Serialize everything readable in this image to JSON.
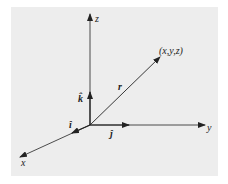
{
  "diagram": {
    "background_color": "#ededed",
    "line_color": "#222222",
    "origin": [
      90,
      125
    ],
    "axes": [
      {
        "name": "x",
        "label": "x",
        "end": [
          20,
          157
        ]
      },
      {
        "name": "y",
        "label": "y",
        "end": [
          205,
          125
        ]
      },
      {
        "name": "z",
        "label": "z",
        "end": [
          90,
          14
        ]
      }
    ],
    "unit_vectors": [
      {
        "name": "i-hat",
        "label": "î",
        "end": [
          73,
          133
        ]
      },
      {
        "name": "j-hat",
        "label": "ĵ",
        "end": [
          128,
          125
        ]
      },
      {
        "name": "k-hat",
        "label": "k̂",
        "end": [
          90,
          93
        ]
      }
    ],
    "position_vector": {
      "label": "r",
      "end": [
        160,
        57
      ],
      "point_label": "(x,y,z)"
    }
  },
  "labels": {
    "x": "x",
    "y": "y",
    "z": "z",
    "i": "î",
    "j": "ĵ",
    "k": "k̂",
    "r": "r",
    "point": "(x,y,z)"
  }
}
